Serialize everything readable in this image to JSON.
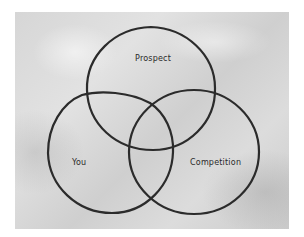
{
  "diagram": {
    "type": "venn",
    "background_color": "#d9d9d9",
    "stroke_color": "#2b2b2b",
    "sets": [
      {
        "id": "prospect",
        "label": "Prospect"
      },
      {
        "id": "you",
        "label": "You"
      },
      {
        "id": "competition",
        "label": "Competition"
      }
    ]
  }
}
